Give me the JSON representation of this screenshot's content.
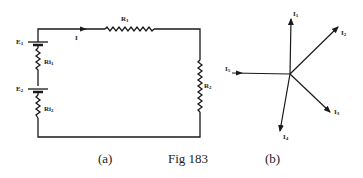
{
  "figure": {
    "caption": "Fig 183",
    "panel_a_label": "(a)",
    "panel_b_label": "(b)"
  },
  "circuit_a": {
    "batteries": [
      {
        "label": "E",
        "sub": "1"
      },
      {
        "label": "E",
        "sub": "2"
      }
    ],
    "internal_resistors": [
      {
        "label": "Ri",
        "sub": "1"
      },
      {
        "label": "Ri",
        "sub": "2"
      }
    ],
    "resistors": [
      {
        "label": "R",
        "sub": "1"
      },
      {
        "label": "R",
        "sub": "2"
      }
    ],
    "current": {
      "label": "I"
    }
  },
  "phasor_b": {
    "vectors": [
      {
        "label": "I",
        "sub": "1",
        "direction": "inward"
      },
      {
        "label": "I",
        "sub": "2",
        "direction": "outward"
      },
      {
        "label": "I",
        "sub": "3",
        "direction": "outward"
      },
      {
        "label": "I",
        "sub": "4",
        "direction": "outward"
      },
      {
        "label": "I",
        "sub": "5",
        "direction": "inward"
      }
    ]
  },
  "colors": {
    "ink": "#1a1a1a",
    "background": "#ffffff"
  }
}
